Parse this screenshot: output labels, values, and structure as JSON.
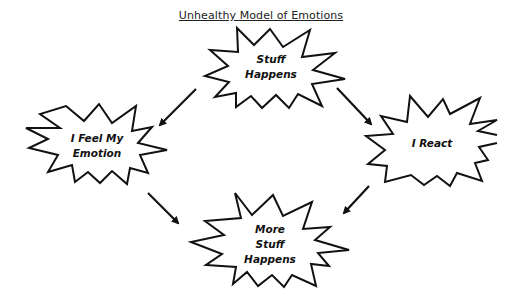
{
  "diagram": {
    "title": "Unhealthy Model of Emotions",
    "nodes": [
      {
        "id": "stuff-happens",
        "lines": [
          "Stuff",
          "Happens"
        ],
        "cx": 271,
        "cy": 65
      },
      {
        "id": "i-feel-my-emotion",
        "lines": [
          "I Feel My",
          "Emotion"
        ],
        "cx": 95,
        "cy": 145
      },
      {
        "id": "i-react",
        "lines": [
          "I React"
        ],
        "cx": 437,
        "cy": 145
      },
      {
        "id": "more-stuff-happens",
        "lines": [
          "More",
          "Stuff",
          "Happens"
        ],
        "cx": 271,
        "cy": 242
      }
    ],
    "edges": [
      {
        "from": "stuff-happens",
        "to": "i-feel-my-emotion"
      },
      {
        "from": "stuff-happens",
        "to": "i-react"
      },
      {
        "from": "i-feel-my-emotion",
        "to": "more-stuff-happens"
      },
      {
        "from": "i-react",
        "to": "more-stuff-happens"
      }
    ],
    "colors": {
      "stroke": "#111111",
      "background": "#ffffff"
    }
  }
}
